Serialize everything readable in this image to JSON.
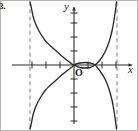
{
  "figure": {
    "item_number": "3.",
    "width": 138,
    "height": 131,
    "background_color": "#ffffff",
    "axis_color": "#2b2b2b",
    "curve_color": "#2b2b2b",
    "asymptote_color": "#8c8c8c",
    "border_color": "#b5b5b5"
  },
  "labels": {
    "y_axis": "y",
    "x_axis": "x",
    "origin": "O"
  },
  "chart_data": {
    "type": "line",
    "title": "",
    "xlabel": "x",
    "ylabel": "y",
    "grid": false,
    "legend": "none",
    "axis_origin_px": {
      "x": 74,
      "y": 65
    },
    "tick_spacing_px": {
      "x": 14,
      "y": 14
    },
    "xlim": [
      -4.6,
      4.6
    ],
    "ylim": [
      -4.6,
      4.6
    ],
    "x_ticks": [
      -3,
      -2,
      -1,
      1,
      2,
      3
    ],
    "y_ticks": [
      -4,
      -3,
      -2,
      -1,
      1,
      2,
      3,
      4
    ],
    "asymptotes": {
      "type": "vertical",
      "x_values": [
        -3.15,
        3.05
      ],
      "style": "dashed",
      "color": "#8c8c8c"
    },
    "series": [
      {
        "name": "upper-branch",
        "description": "decreasing branch from top near left asymptote through the origin then rising steeply to the right asymptote",
        "points_px": [
          [
            30,
            2
          ],
          [
            31,
            6
          ],
          [
            32,
            11
          ],
          [
            33,
            16
          ],
          [
            34.5,
            21
          ],
          [
            36.5,
            26
          ],
          [
            39,
            31
          ],
          [
            42,
            36
          ],
          [
            45.5,
            41
          ],
          [
            49.5,
            45
          ],
          [
            54,
            49
          ],
          [
            58.5,
            53
          ],
          [
            63,
            57
          ],
          [
            68,
            61
          ],
          [
            72,
            64
          ],
          [
            74,
            65
          ],
          [
            76,
            66
          ],
          [
            80,
            67.5
          ],
          [
            85,
            68
          ],
          [
            90,
            67.5
          ],
          [
            95,
            65
          ],
          [
            100,
            60
          ],
          [
            105,
            52
          ],
          [
            109,
            42
          ],
          [
            112,
            31
          ],
          [
            114,
            20
          ],
          [
            115.5,
            10
          ],
          [
            116.5,
            2
          ]
        ]
      },
      {
        "name": "lower-branch",
        "description": "mirror image branch rising from bottom near left asymptote through the origin then falling steeply to the right asymptote",
        "points_px": [
          [
            30,
            129
          ],
          [
            31,
            125
          ],
          [
            32,
            120
          ],
          [
            33,
            115
          ],
          [
            34.5,
            110
          ],
          [
            36.5,
            105
          ],
          [
            39,
            100
          ],
          [
            42,
            95
          ],
          [
            45.5,
            90
          ],
          [
            49.5,
            86
          ],
          [
            54,
            82
          ],
          [
            58.5,
            78
          ],
          [
            63,
            74
          ],
          [
            68,
            70
          ],
          [
            72,
            67
          ],
          [
            74,
            65
          ],
          [
            76,
            64
          ],
          [
            80,
            63
          ],
          [
            85,
            62.5
          ],
          [
            90,
            63
          ],
          [
            95,
            65
          ],
          [
            100,
            71
          ],
          [
            105,
            79
          ],
          [
            109,
            89
          ],
          [
            112,
            100
          ],
          [
            114,
            111
          ],
          [
            115.5,
            121
          ],
          [
            116.5,
            129
          ]
        ]
      }
    ]
  }
}
